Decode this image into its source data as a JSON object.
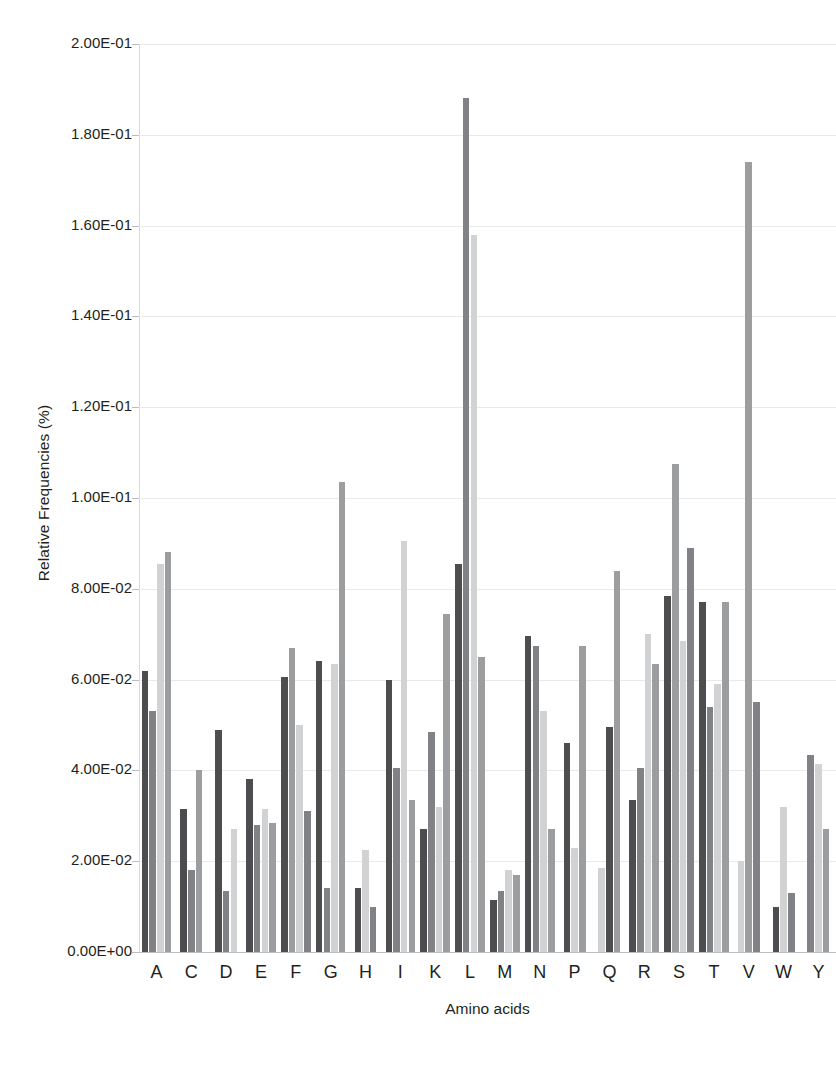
{
  "chart_data": {
    "type": "bar",
    "title": "",
    "xlabel": "Amino acids",
    "ylabel": "Relative Frequencies (%)",
    "ylim": [
      0,
      0.2
    ],
    "grid": true,
    "legend": "none",
    "y_tick_labels": [
      "2.00E-01",
      "1.80E-01",
      "1.60E-01",
      "1.40E-01",
      "1.20E-01",
      "1.00E-01",
      "8.00E-02",
      "6.00E-02",
      "4.00E-02",
      "2.00E-02",
      "0.00E+00"
    ],
    "y_tick_values": [
      0.2,
      0.18,
      0.16,
      0.14,
      0.12,
      0.1,
      0.08,
      0.06,
      0.04,
      0.02,
      0
    ],
    "categories": [
      "A",
      "C",
      "D",
      "E",
      "F",
      "G",
      "H",
      "I",
      "K",
      "L",
      "M",
      "N",
      "P",
      "Q",
      "R",
      "S",
      "T",
      "V",
      "W",
      "Y"
    ],
    "series": [
      {
        "name": "Series 1",
        "color": "#4d4d4f",
        "values": [
          0.062,
          0.0315,
          0.049,
          0.028,
          0.0605,
          0.064,
          0.014,
          0.06,
          0.027,
          0.0855,
          0.0115,
          0.0695,
          0.046,
          0.0,
          0.0335,
          0.0785,
          0.077,
          0.077,
          0.01,
          0.0
        ]
      },
      {
        "name": "Series 2",
        "color": "#808285",
        "values": [
          0.053,
          0.0,
          0.0135,
          0.038,
          0.067,
          0.014,
          0.0,
          0.0405,
          0.0485,
          0.188,
          0.0,
          0.0675,
          0.027,
          0.0,
          0.0405,
          0.0,
          0.054,
          0.0,
          0.0,
          0.0435
        ]
      },
      {
        "name": "Series 3",
        "color": "#d0d2d3",
        "values": [
          0.0855,
          0.0,
          0.027,
          0.0315,
          0.05,
          0.0635,
          0.0225,
          0.0905,
          0.032,
          0.158,
          0.018,
          0.053,
          0.023,
          0.0185,
          0.07,
          0.0685,
          0.059,
          0.0,
          0.032,
          0.0415
        ]
      },
      {
        "name": "Series 4",
        "color": "#9b9d9f",
        "values": [
          0.088,
          0.04,
          0.0,
          0.0285,
          0.031,
          0.1035,
          0.0,
          0.0335,
          0.0745,
          0.065,
          0.017,
          0.0,
          0.0675,
          0.0495,
          0.0635,
          0.089,
          0.0,
          0.174,
          0.013,
          0.027
        ]
      },
      {
        "name": "Series 5",
        "color": "#4d4d4f",
        "values": [
          0.0,
          0.018,
          0.0,
          0.0,
          0.0,
          0.0,
          0.0,
          0.0,
          0.0,
          0.0,
          0.0,
          0.0,
          0.0,
          0.0,
          0.0,
          0.0,
          0.0,
          0.055,
          0.0,
          0.0
        ]
      }
    ],
    "group_bars": [
      [
        {
          "v": 0.062,
          "s": 0
        },
        {
          "v": 0.053,
          "s": 1
        },
        {
          "v": 0.0855,
          "s": 2
        },
        {
          "v": 0.088,
          "s": 3
        }
      ],
      [
        {
          "v": 0.0315,
          "s": 0
        },
        {
          "v": 0.018,
          "s": 1
        },
        {
          "v": 0.04,
          "s": 3
        }
      ],
      [
        {
          "v": 0.049,
          "s": 0
        },
        {
          "v": 0.0135,
          "s": 1
        },
        {
          "v": 0.027,
          "s": 2
        }
      ],
      [
        {
          "v": 0.038,
          "s": 0
        },
        {
          "v": 0.028,
          "s": 1
        },
        {
          "v": 0.0315,
          "s": 2
        },
        {
          "v": 0.0285,
          "s": 3
        }
      ],
      [
        {
          "v": 0.0605,
          "s": 0
        },
        {
          "v": 0.067,
          "s": 3
        },
        {
          "v": 0.05,
          "s": 2
        },
        {
          "v": 0.031,
          "s": 1
        }
      ],
      [
        {
          "v": 0.064,
          "s": 0
        },
        {
          "v": 0.014,
          "s": 1
        },
        {
          "v": 0.0635,
          "s": 2
        },
        {
          "v": 0.1035,
          "s": 3
        }
      ],
      [
        {
          "v": 0.014,
          "s": 0
        },
        {
          "v": 0.0225,
          "s": 2
        },
        {
          "v": 0.01,
          "s": 1
        }
      ],
      [
        {
          "v": 0.06,
          "s": 0
        },
        {
          "v": 0.0405,
          "s": 1
        },
        {
          "v": 0.0905,
          "s": 2
        },
        {
          "v": 0.0335,
          "s": 3
        }
      ],
      [
        {
          "v": 0.027,
          "s": 0
        },
        {
          "v": 0.0485,
          "s": 1
        },
        {
          "v": 0.032,
          "s": 2
        },
        {
          "v": 0.0745,
          "s": 3
        }
      ],
      [
        {
          "v": 0.0855,
          "s": 0
        },
        {
          "v": 0.188,
          "s": 1
        },
        {
          "v": 0.158,
          "s": 2
        },
        {
          "v": 0.065,
          "s": 3
        }
      ],
      [
        {
          "v": 0.0115,
          "s": 0
        },
        {
          "v": 0.0135,
          "s": 1
        },
        {
          "v": 0.018,
          "s": 2
        },
        {
          "v": 0.017,
          "s": 3
        }
      ],
      [
        {
          "v": 0.0695,
          "s": 0
        },
        {
          "v": 0.0675,
          "s": 1
        },
        {
          "v": 0.053,
          "s": 2
        },
        {
          "v": 0.027,
          "s": 3
        }
      ],
      [
        {
          "v": 0.046,
          "s": 0
        },
        {
          "v": 0.023,
          "s": 2
        },
        {
          "v": 0.0675,
          "s": 3
        }
      ],
      [
        {
          "v": 0.0185,
          "s": 2
        },
        {
          "v": 0.0495,
          "s": 0
        },
        {
          "v": 0.084,
          "s": 3
        }
      ],
      [
        {
          "v": 0.0335,
          "s": 0
        },
        {
          "v": 0.0405,
          "s": 1
        },
        {
          "v": 0.07,
          "s": 2
        },
        {
          "v": 0.0635,
          "s": 3
        }
      ],
      [
        {
          "v": 0.0785,
          "s": 0
        },
        {
          "v": 0.1075,
          "s": 3
        },
        {
          "v": 0.0685,
          "s": 2
        },
        {
          "v": 0.089,
          "s": 1
        }
      ],
      [
        {
          "v": 0.077,
          "s": 0
        },
        {
          "v": 0.054,
          "s": 1
        },
        {
          "v": 0.059,
          "s": 2
        },
        {
          "v": 0.077,
          "s": 3
        }
      ],
      [
        {
          "v": 0.02,
          "s": 2
        },
        {
          "v": 0.174,
          "s": 3
        },
        {
          "v": 0.055,
          "s": 1
        }
      ],
      [
        {
          "v": 0.01,
          "s": 0
        },
        {
          "v": 0.032,
          "s": 2
        },
        {
          "v": 0.013,
          "s": 1
        }
      ],
      [
        {
          "v": 0.0435,
          "s": 1
        },
        {
          "v": 0.0415,
          "s": 2
        },
        {
          "v": 0.027,
          "s": 3
        }
      ]
    ],
    "caption": ""
  }
}
